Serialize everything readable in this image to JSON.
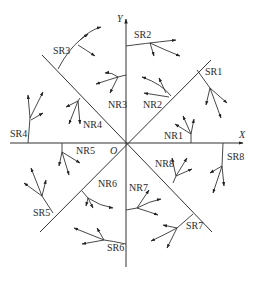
{
  "axes": {
    "x_label": "X",
    "y_label": "Y",
    "origin_label": "O"
  },
  "regions": [
    {
      "id": "SR1",
      "label": "SR1",
      "x": 205,
      "y": 67
    },
    {
      "id": "SR2",
      "label": "SR2",
      "x": 134,
      "y": 30
    },
    {
      "id": "SR3",
      "label": "SR3",
      "x": 53,
      "y": 46
    },
    {
      "id": "SR4",
      "label": "SR4",
      "x": 10,
      "y": 129
    },
    {
      "id": "SR5",
      "label": "SR5",
      "x": 33,
      "y": 208
    },
    {
      "id": "SR6",
      "label": "SR6",
      "x": 107,
      "y": 243
    },
    {
      "id": "SR7",
      "label": "SR7",
      "x": 186,
      "y": 221
    },
    {
      "id": "SR8",
      "label": "SR8",
      "x": 227,
      "y": 152
    },
    {
      "id": "NR1",
      "label": "NR1",
      "x": 164,
      "y": 131
    },
    {
      "id": "NR2",
      "label": "NR2",
      "x": 143,
      "y": 100
    },
    {
      "id": "NR3",
      "label": "NR3",
      "x": 108,
      "y": 100
    },
    {
      "id": "NR4",
      "label": "NR4",
      "x": 83,
      "y": 120
    },
    {
      "id": "NR5",
      "label": "NR5",
      "x": 76,
      "y": 146
    },
    {
      "id": "NR6",
      "label": "NR6",
      "x": 98,
      "y": 179
    },
    {
      "id": "NR7",
      "label": "NR7",
      "x": 129,
      "y": 183
    },
    {
      "id": "NR8",
      "label": "NR8",
      "x": 155,
      "y": 159
    }
  ]
}
